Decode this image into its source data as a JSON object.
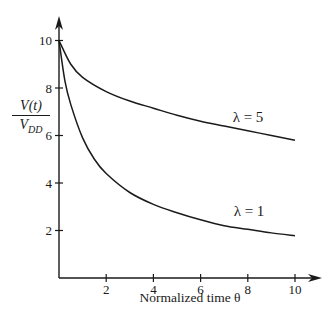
{
  "chart_data": {
    "type": "line",
    "title": "",
    "xlabel": "Normalized time θ",
    "ylabel": "V(t) / V_DD",
    "ylabel_num": "V(t)",
    "ylabel_den_main": "V",
    "ylabel_den_sub": "DD",
    "xlim": [
      0,
      10.5
    ],
    "ylim": [
      0,
      11
    ],
    "xticks": [
      2,
      4,
      6,
      8,
      10
    ],
    "yticks": [
      2,
      4,
      6,
      8,
      10
    ],
    "grid": false,
    "legend": "inline labels",
    "series": [
      {
        "name": "λ = 5",
        "label": "λ = 5",
        "x": [
          0,
          0.5,
          1,
          2,
          3,
          4,
          5,
          6,
          7,
          8,
          9,
          10
        ],
        "y": [
          10,
          9.0,
          8.45,
          7.85,
          7.45,
          7.15,
          6.85,
          6.6,
          6.4,
          6.2,
          6.0,
          5.8
        ]
      },
      {
        "name": "λ = 1",
        "label": "λ = 1",
        "x": [
          0,
          0.25,
          0.5,
          1,
          1.5,
          2,
          3,
          4,
          5,
          6,
          7,
          8,
          9,
          10
        ],
        "y": [
          10,
          8.3,
          7.3,
          5.9,
          5.0,
          4.4,
          3.6,
          3.1,
          2.75,
          2.45,
          2.2,
          2.05,
          1.9,
          1.78
        ]
      }
    ]
  }
}
